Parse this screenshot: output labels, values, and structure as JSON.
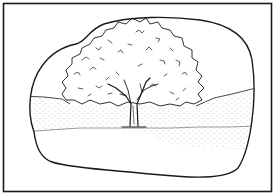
{
  "illustration": {
    "subject": "tree in a field",
    "style": "black and white line drawing",
    "elements": {
      "frame": "rectangular border",
      "vignette": "rounded blob outline",
      "tree_crown": "leafy canopy",
      "tree_trunk": "forked trunk",
      "field": "stippled grass band",
      "ground": "blank foreground"
    },
    "colors": {
      "ink": "#1a1a1a",
      "paper": "#ffffff",
      "stipple": "#8a8a8a"
    }
  }
}
